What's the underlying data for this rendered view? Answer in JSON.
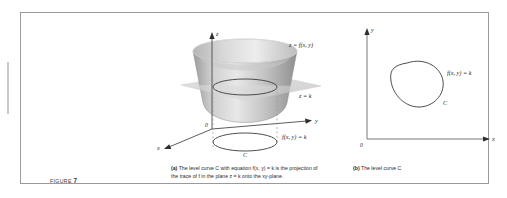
{
  "figure": {
    "label_word": "FIGURE",
    "number": "7",
    "frame_color": "#9a9a9a",
    "background": "#ffffff"
  },
  "panel_a": {
    "id": "a",
    "axes": {
      "z_label": "z",
      "y_label": "y",
      "x_label": "x",
      "origin_label": "0"
    },
    "labels": {
      "surface": "z = f(x, y)",
      "plane": "z = k",
      "level_curve_equation": "f(x, y) = k",
      "curve_name": "C"
    },
    "colors": {
      "surface_light": "#e9e9e9",
      "surface_mid": "#b8b8b8",
      "surface_dark": "#8c8c8c",
      "plane_fill": "#d8d8d8",
      "axis": "#4a4a4a",
      "curve": "#3a3a3a",
      "dashed": "#9a9a9a"
    }
  },
  "panel_b": {
    "id": "b",
    "axes": {
      "y_label": "y",
      "x_label": "x",
      "origin_label": "0"
    },
    "labels": {
      "level_curve_equation": "f(x, y) = k",
      "curve_name": "C"
    },
    "colors": {
      "axis": "#6a6a6a",
      "curve": "#3a3a3a"
    }
  },
  "captions": {
    "a": {
      "tag": "(a)",
      "text": "The level curve C with equation f(x, y) = k is the projection of the trace of f in the plane z = k onto the xy-plane."
    },
    "b": {
      "tag": "(b)",
      "text": "The level curve C"
    }
  }
}
